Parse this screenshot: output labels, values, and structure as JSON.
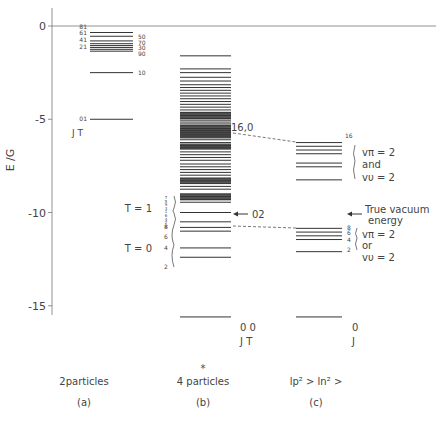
{
  "figure": {
    "axis": {
      "ylabel": "E /G",
      "ticks": [
        {
          "value": 0,
          "label": "0"
        },
        {
          "value": -5,
          "label": "-5"
        },
        {
          "value": -10,
          "label": "-10"
        },
        {
          "value": -15,
          "label": "-15"
        }
      ],
      "px_zero": 26,
      "px_per_unit": 18.65
    },
    "panels": [
      {
        "id": "a",
        "caption": "2particles",
        "sublabel": "(a)",
        "x1": 90,
        "x2": 133,
        "levels": [
          0.0,
          -0.35,
          -0.55,
          -0.8,
          -0.95,
          -1.05,
          -1.15,
          -1.25,
          -1.35,
          -2.5,
          -5.0
        ],
        "left_labels": [
          {
            "text": "81",
            "e": -0.05
          },
          {
            "text": "61",
            "e": -0.4
          },
          {
            "text": "41",
            "e": -0.75
          },
          {
            "text": "21",
            "e": -1.15
          },
          {
            "text": "01",
            "e": -5.0
          }
        ],
        "right_labels": [
          {
            "text": "50",
            "e": -0.6
          },
          {
            "text": "70",
            "e": -0.9
          },
          {
            "text": "30",
            "e": -1.2
          },
          {
            "text": "90",
            "e": -1.5
          },
          {
            "text": "10",
            "e": -2.5
          }
        ],
        "jt_label": "J  T",
        "jt_e": -5.7
      },
      {
        "id": "b",
        "caption": "4 particles",
        "star": "*",
        "sublabel": "(b)",
        "x1": 180,
        "x2": 231,
        "levels": [
          -1.6,
          -2.3,
          -2.5,
          -2.75,
          -2.95,
          -3.15,
          -3.3,
          -3.45,
          -3.6,
          -3.75,
          -3.9,
          -4.05,
          -4.2,
          -4.35,
          -4.5,
          -4.65,
          -4.8,
          -4.95,
          -5.05,
          -5.15,
          -5.25,
          -5.35,
          -5.5,
          -5.6,
          -5.7,
          -5.8,
          -5.9,
          -6.0,
          -6.1,
          -6.25,
          -6.4,
          -6.5,
          -6.6,
          -6.75,
          -6.9,
          -7.05,
          -7.2,
          -7.4,
          -7.55,
          -7.7,
          -7.85,
          -8.0,
          -8.15,
          -8.3,
          -8.45,
          -8.6,
          -8.75,
          -9.0,
          -9.15,
          -9.3,
          -9.45,
          -10.0,
          -10.5,
          -10.8,
          -11.0,
          -11.9,
          -12.4,
          -15.6
        ],
        "dense_bands": [
          [
            -4.6,
            -5.0
          ],
          [
            -5.3,
            -6.0
          ],
          [
            -6.3,
            -6.6
          ],
          [
            -8.15,
            -8.45
          ],
          [
            -9.0,
            -9.35
          ]
        ],
        "side_labels_T1": [
          "7",
          "5",
          "9",
          "3",
          "1",
          "6",
          "4",
          "2",
          "8"
        ],
        "side_labels_T0": [
          {
            "text": "8",
            "e": -10.8
          },
          {
            "text": "6",
            "e": -11.3
          },
          {
            "text": "4",
            "e": -11.9
          },
          {
            "text": "2",
            "e": -12.9
          }
        ],
        "T1_label": "T = 1",
        "T0_label": "T = 0",
        "label_16_0": "16,0",
        "label_02": "02",
        "ground_label": "0  0",
        "ground_jt": "J  T"
      },
      {
        "id": "c",
        "caption": "lp² > ln² >",
        "sublabel": "(c)",
        "x1": 296,
        "x2": 342,
        "levels": [
          -6.25,
          -6.45,
          -6.65,
          -6.85,
          -7.35,
          -7.55,
          -8.25,
          -10.85,
          -11.05,
          -11.25,
          -11.45,
          -12.1,
          -15.6
        ],
        "label_16": "16",
        "group_upper": {
          "line1": "vπ = 2",
          "line2": "and",
          "line3": "vυ = 2"
        },
        "group_lower_labels": [
          {
            "text": "8",
            "e": -10.85
          },
          {
            "text": "6",
            "e": -11.1
          },
          {
            "text": "4",
            "e": -11.45
          },
          {
            "text": "2",
            "e": -12.0
          }
        ],
        "group_lower": {
          "line1": "vπ = 2",
          "line2": "or",
          "line3": "vυ = 2"
        },
        "true_vacuum": {
          "line1": "True vacuum",
          "line2": "energy",
          "e": -10.0
        },
        "ground_label": "0",
        "ground_j": "J"
      }
    ],
    "colors": {
      "line": "#333333",
      "text": "#444444",
      "background": "#ffffff"
    }
  }
}
